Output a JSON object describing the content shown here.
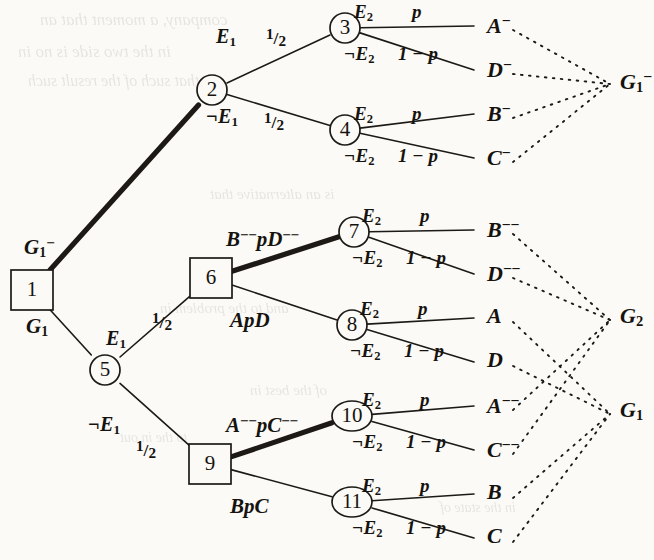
{
  "figure": {
    "colors": {
      "page_background": "#fbfaf7",
      "ink": "#16130f",
      "line": "#1d1a16",
      "ghost_text": "#5d584f"
    }
  },
  "nodes": [
    {
      "id": "1",
      "label": "1",
      "shape": "square",
      "x": 32,
      "y": 290
    },
    {
      "id": "2",
      "label": "2",
      "shape": "circle",
      "x": 212,
      "y": 90
    },
    {
      "id": "3",
      "label": "3",
      "shape": "circle",
      "x": 345,
      "y": 28
    },
    {
      "id": "4",
      "label": "4",
      "shape": "circle",
      "x": 345,
      "y": 130
    },
    {
      "id": "5",
      "label": "5",
      "shape": "circle",
      "x": 105,
      "y": 370
    },
    {
      "id": "6",
      "label": "6",
      "shape": "square",
      "x": 211,
      "y": 278
    },
    {
      "id": "7",
      "label": "7",
      "shape": "circle",
      "x": 354,
      "y": 232
    },
    {
      "id": "8",
      "label": "8",
      "shape": "circle",
      "x": 352,
      "y": 325
    },
    {
      "id": "9",
      "label": "9",
      "shape": "square",
      "x": 210,
      "y": 464
    },
    {
      "id": "10",
      "label": "10",
      "shape": "oval",
      "x": 352,
      "y": 416
    },
    {
      "id": "11",
      "label": "11",
      "shape": "oval",
      "x": 352,
      "y": 502
    }
  ],
  "edge_labels": {
    "root_up": {
      "text": "G",
      "sub": "1",
      "sup": "−"
    },
    "root_down": {
      "text": "G",
      "sub": "1",
      "sup": ""
    },
    "n2_up_event": "E",
    "n2_up_event_sub": "1",
    "n2_up_prob": "1/2",
    "n2_down_event": "¬E",
    "n2_down_event_sub": "1",
    "n2_down_prob": "1/2",
    "n5_up_event": "E",
    "n5_up_event_sub": "1",
    "n5_up_prob": "1/2",
    "n5_down_event": "¬E",
    "n5_down_event_sub": "1",
    "n5_down_prob": "1/2",
    "n6_up": "B−−pD−−",
    "n6_down": "ApD",
    "n9_up": "A−−pC−−",
    "n9_down": "BpC",
    "chance_up_event": "E",
    "chance_up_event_sub": "2",
    "chance_up_prob": "p",
    "chance_down_event": "¬E",
    "chance_down_event_sub": "2",
    "chance_down_prob": "1 − p"
  },
  "leaves": [
    {
      "id": "L1",
      "base": "A",
      "sup": "−",
      "x": 487,
      "y": 26
    },
    {
      "id": "L2",
      "base": "D",
      "sup": "−",
      "x": 487,
      "y": 70
    },
    {
      "id": "L3",
      "base": "B",
      "sup": "−",
      "x": 487,
      "y": 114
    },
    {
      "id": "L4",
      "base": "C",
      "sup": "−",
      "x": 487,
      "y": 158
    },
    {
      "id": "L5",
      "base": "B",
      "sup": "−−",
      "x": 487,
      "y": 230
    },
    {
      "id": "L6",
      "base": "D",
      "sup": "−−",
      "x": 487,
      "y": 274
    },
    {
      "id": "L7",
      "base": "A",
      "sup": "",
      "x": 487,
      "y": 318
    },
    {
      "id": "L8",
      "base": "D",
      "sup": "",
      "x": 487,
      "y": 362
    },
    {
      "id": "L9",
      "base": "A",
      "sup": "−−",
      "x": 487,
      "y": 406
    },
    {
      "id": "L10",
      "base": "C",
      "sup": "−−",
      "x": 487,
      "y": 450
    },
    {
      "id": "L11",
      "base": "B",
      "sup": "",
      "x": 487,
      "y": 494
    },
    {
      "id": "L12",
      "base": "C",
      "sup": "",
      "x": 487,
      "y": 538
    }
  ],
  "groups": [
    {
      "id": "G1minus",
      "base": "G",
      "sub": "1",
      "sup": "−",
      "x": 620,
      "y": 82,
      "members": [
        "L1",
        "L2",
        "L3",
        "L4"
      ]
    },
    {
      "id": "G2",
      "base": "G",
      "sub": "2",
      "sup": "",
      "x": 620,
      "y": 318,
      "members": [
        "L5",
        "L6",
        "L9",
        "L10"
      ]
    },
    {
      "id": "G1",
      "base": "G",
      "sub": "1",
      "sup": "",
      "x": 620,
      "y": 412,
      "members": [
        "L7",
        "L8",
        "L11",
        "L12"
      ]
    }
  ],
  "ghost_text": [
    {
      "text": "company, a moment that an",
      "x": 40,
      "y": 10,
      "size": 17
    },
    {
      "text": "in the two side is no in",
      "x": 18,
      "y": 42,
      "size": 17
    },
    {
      "text": "that such of the result such",
      "x": 28,
      "y": 72,
      "size": 16
    },
    {
      "text": "is an alternative that",
      "x": 210,
      "y": 186,
      "size": 15
    },
    {
      "text": "and to the problem in",
      "x": 160,
      "y": 300,
      "size": 15
    },
    {
      "text": "of the best in",
      "x": 250,
      "y": 382,
      "size": 15
    },
    {
      "text": "to the in out",
      "x": 120,
      "y": 430,
      "size": 14
    },
    {
      "text": "in the state of",
      "x": 440,
      "y": 500,
      "size": 14
    }
  ]
}
